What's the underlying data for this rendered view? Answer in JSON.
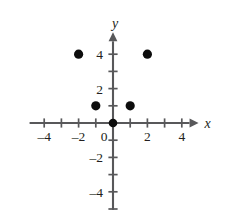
{
  "chart_data": {
    "type": "scatter",
    "title": "",
    "xlabel": "x",
    "ylabel": "y",
    "xlim": [
      -5,
      5
    ],
    "ylim": [
      -5,
      5
    ],
    "grid": false,
    "legend": null,
    "x_tick_labels": [
      "-4",
      "-2",
      "0",
      "2",
      "4"
    ],
    "x_tick_values": [
      -4,
      -2,
      0,
      2,
      4
    ],
    "y_tick_labels": [
      "4",
      "2",
      "-2",
      "-4"
    ],
    "y_tick_values": [
      4,
      2,
      -2,
      -4
    ],
    "minor_tick_step": 1,
    "points": [
      {
        "x": -2,
        "y": 4,
        "label": "(-2, 4)"
      },
      {
        "x": 2,
        "y": 4,
        "label": "(2, 4)"
      },
      {
        "x": -1,
        "y": 1,
        "label": "(-1, 1)"
      },
      {
        "x": 1,
        "y": 1,
        "label": "(1, 1)"
      }
    ],
    "origin_marker": true,
    "colors": {
      "point": "#0d0d0d",
      "axis": "#58585a",
      "text": "#231f20",
      "background": "#ffffff"
    }
  },
  "figure": {
    "x_axis_name": "x-axis",
    "y_axis_name": "y-axis"
  }
}
